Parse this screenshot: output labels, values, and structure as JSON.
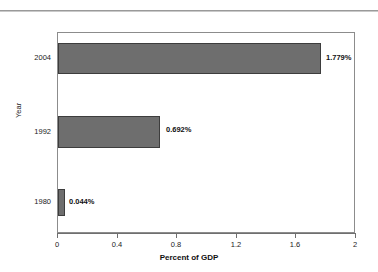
{
  "chart_data": {
    "type": "bar",
    "orientation": "horizontal",
    "title": "",
    "subtitle": "",
    "categories": [
      "2004",
      "1992",
      "1980"
    ],
    "values": [
      1.779,
      0.692,
      0.044
    ],
    "data_labels": [
      "1.779%",
      "0.692%",
      "0.044%"
    ],
    "xlabel": "Percent of GDP",
    "ylabel": "Year",
    "xlim": [
      0,
      2
    ],
    "xticks": [
      0,
      0.4,
      0.8,
      1.2,
      1.6,
      2
    ],
    "xtick_labels": [
      "0",
      "0.4",
      "0.8",
      "1.2",
      "1.6",
      "2"
    ],
    "grid": false,
    "legend": false,
    "series": [
      {
        "name": "Percent of GDP",
        "values": [
          1.779,
          0.692,
          0.044
        ]
      }
    ],
    "colors": {
      "bar_fill": "#6e6e6e",
      "bar_border": "#3d3d3d",
      "plot_border": "#8c8c8c",
      "axis": "#6f6f6f",
      "text": "#1a1a1a",
      "background": "#ffffff"
    }
  },
  "axes": {
    "x": {
      "title": "Percent of GDP",
      "ticks": [
        {
          "label": "0",
          "value": 0
        },
        {
          "label": "0.4",
          "value": 0.4
        },
        {
          "label": "0.8",
          "value": 0.8
        },
        {
          "label": "1.2",
          "value": 1.2
        },
        {
          "label": "1.6",
          "value": 1.6
        },
        {
          "label": "2",
          "value": 2
        }
      ]
    },
    "y": {
      "title": "Year",
      "categories": [
        "2004",
        "1992",
        "1980"
      ]
    }
  },
  "bars": [
    {
      "category": "2004",
      "value": 1.779,
      "label": "1.779%"
    },
    {
      "category": "1992",
      "value": 0.692,
      "label": "0.692%"
    },
    {
      "category": "1980",
      "value": 0.044,
      "label": "0.044%"
    }
  ]
}
